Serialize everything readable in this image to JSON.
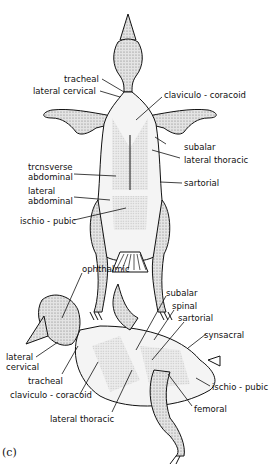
{
  "figure": {
    "panel_label": "(c)",
    "ventral_view": {
      "labels": {
        "tracheal": "tracheal",
        "lateral_cervical": "lateral cervical",
        "claviculo_coracoid": "claviculo - coracoid",
        "subalar": "subalar",
        "lateral_thoracic": "lateral thoracic",
        "transverse_abdominal_1": "trcnsverse",
        "transverse_abdominal_2": "abdominal",
        "lateral_abdominal_1": "lateral",
        "lateral_abdominal_2": "abdominal",
        "sartorial": "sartorial",
        "ischio_pubic": "ischio - pubic"
      }
    },
    "lateral_view": {
      "labels": {
        "ophthalmic": "ophthalmic",
        "subalar": "subalar",
        "spinal": "spinal",
        "sartorial": "sartorial",
        "synsacral": "synsacral",
        "lateral_cervical_1": "lateral",
        "lateral_cervical_2": "cervical",
        "tracheal": "tracheal",
        "claviculo_coracoid": "claviculo - coracoid",
        "lateral_thoracic": "lateral thoracic",
        "ischio_pubic": "ischio - pubic",
        "femoral": "femoral"
      }
    }
  }
}
